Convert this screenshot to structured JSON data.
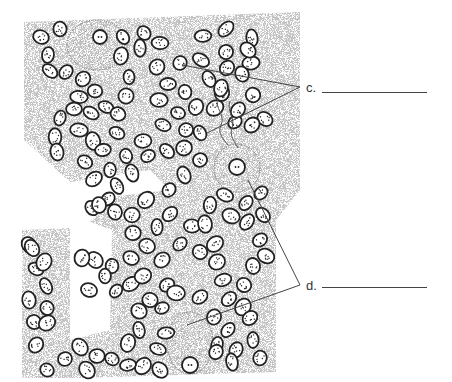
{
  "figure": {
    "cell_color": "#222222",
    "stipple_color": "#999999"
  },
  "labels": [
    {
      "id": "c",
      "text": "c.",
      "x": 306,
      "y": 80,
      "blank_x1": 322,
      "blank_x2": 427,
      "blank_y": 92,
      "leaders": [
        {
          "from": [
            182,
            65
          ],
          "to": [
            300,
            87
          ]
        },
        {
          "from": [
            207,
            133
          ],
          "to": [
            300,
            87
          ]
        }
      ]
    },
    {
      "id": "d",
      "text": "d.",
      "x": 306,
      "y": 278,
      "blank_x1": 322,
      "blank_x2": 427,
      "blank_y": 287,
      "leaders": [
        {
          "from": [
            248,
            180
          ],
          "to": [
            300,
            285
          ]
        },
        {
          "from": [
            187,
            325
          ],
          "to": [
            300,
            285
          ]
        }
      ]
    }
  ],
  "large_cells": [
    {
      "cx": 97,
      "cy": 45,
      "rx": 30,
      "ry": 25,
      "nx": 100,
      "ny": 37,
      "nr": 7
    },
    {
      "cx": 237,
      "cy": 168,
      "rx": 23,
      "ry": 24,
      "nx": 237,
      "ny": 167,
      "nr": 8
    },
    {
      "cx": 190,
      "cy": 343,
      "rx": 23,
      "ry": 31,
      "nx": 190,
      "ny": 365,
      "nr": 8
    }
  ],
  "small_cells": [
    [
      41,
      37
    ],
    [
      60,
      29
    ],
    [
      48,
      55
    ],
    [
      50,
      71
    ],
    [
      66,
      72
    ],
    [
      83,
      79
    ],
    [
      79,
      97
    ],
    [
      95,
      91
    ],
    [
      74,
      109
    ],
    [
      60,
      118
    ],
    [
      55,
      137
    ],
    [
      57,
      152
    ],
    [
      79,
      130
    ],
    [
      91,
      113
    ],
    [
      106,
      107
    ],
    [
      93,
      141
    ],
    [
      118,
      114
    ],
    [
      117,
      133
    ],
    [
      126,
      96
    ],
    [
      129,
      77
    ],
    [
      121,
      56
    ],
    [
      123,
      37
    ],
    [
      144,
      33
    ],
    [
      140,
      48
    ],
    [
      160,
      43
    ],
    [
      157,
      67
    ],
    [
      168,
      84
    ],
    [
      159,
      100
    ],
    [
      180,
      63
    ],
    [
      201,
      60
    ],
    [
      209,
      79
    ],
    [
      185,
      92
    ],
    [
      178,
      113
    ],
    [
      163,
      125
    ],
    [
      143,
      141
    ],
    [
      148,
      156
    ],
    [
      126,
      156
    ],
    [
      132,
      173
    ],
    [
      110,
      170
    ],
    [
      117,
      186
    ],
    [
      94,
      179
    ],
    [
      85,
      162
    ],
    [
      103,
      150
    ],
    [
      167,
      151
    ],
    [
      184,
      148
    ],
    [
      200,
      133
    ],
    [
      186,
      130
    ],
    [
      215,
      108
    ],
    [
      222,
      93
    ],
    [
      196,
      107
    ],
    [
      203,
      36
    ],
    [
      226,
      29
    ],
    [
      226,
      52
    ],
    [
      252,
      38
    ],
    [
      251,
      63
    ],
    [
      248,
      50
    ],
    [
      242,
      74
    ],
    [
      253,
      95
    ],
    [
      265,
      119
    ],
    [
      252,
      125
    ],
    [
      235,
      122
    ],
    [
      238,
      110
    ],
    [
      227,
      68
    ],
    [
      221,
      88
    ],
    [
      200,
      160
    ],
    [
      184,
      175
    ],
    [
      169,
      190
    ],
    [
      146,
      200
    ],
    [
      108,
      199
    ],
    [
      92,
      208
    ],
    [
      115,
      212
    ],
    [
      132,
      215
    ],
    [
      99,
      205
    ],
    [
      133,
      233
    ],
    [
      147,
      246
    ],
    [
      131,
      258
    ],
    [
      112,
      266
    ],
    [
      95,
      260
    ],
    [
      82,
      258
    ],
    [
      89,
      290
    ],
    [
      105,
      276
    ],
    [
      116,
      291
    ],
    [
      131,
      284
    ],
    [
      143,
      276
    ],
    [
      162,
      260
    ],
    [
      180,
      244
    ],
    [
      157,
      227
    ],
    [
      170,
      214
    ],
    [
      192,
      226
    ],
    [
      205,
      224
    ],
    [
      215,
      244
    ],
    [
      200,
      252
    ],
    [
      217,
      262
    ],
    [
      223,
      280
    ],
    [
      229,
      299
    ],
    [
      243,
      307
    ],
    [
      244,
      285
    ],
    [
      253,
      266
    ],
    [
      266,
      256
    ],
    [
      260,
      240
    ],
    [
      247,
      222
    ],
    [
      263,
      215
    ],
    [
      261,
      193
    ],
    [
      246,
      203
    ],
    [
      231,
      216
    ],
    [
      225,
      195
    ],
    [
      210,
      205
    ],
    [
      167,
      285
    ],
    [
      150,
      300
    ],
    [
      139,
      311
    ],
    [
      139,
      330
    ],
    [
      128,
      343
    ],
    [
      162,
      308
    ],
    [
      176,
      293
    ],
    [
      200,
      297
    ],
    [
      214,
      317
    ],
    [
      228,
      330
    ],
    [
      250,
      318
    ],
    [
      253,
      340
    ],
    [
      260,
      358
    ],
    [
      236,
      350
    ],
    [
      217,
      345
    ],
    [
      216,
      352
    ],
    [
      232,
      362
    ],
    [
      166,
      333
    ],
    [
      158,
      349
    ],
    [
      160,
      370
    ],
    [
      143,
      366
    ],
    [
      128,
      365
    ],
    [
      112,
      359
    ],
    [
      97,
      356
    ],
    [
      80,
      347
    ],
    [
      87,
      370
    ],
    [
      65,
      359
    ],
    [
      47,
      370
    ],
    [
      36,
      345
    ],
    [
      34,
      322
    ],
    [
      47,
      323
    ],
    [
      29,
      300
    ],
    [
      46,
      286
    ],
    [
      36,
      269
    ],
    [
      44,
      262
    ],
    [
      29,
      245
    ],
    [
      32,
      248
    ],
    [
      47,
      308
    ]
  ]
}
